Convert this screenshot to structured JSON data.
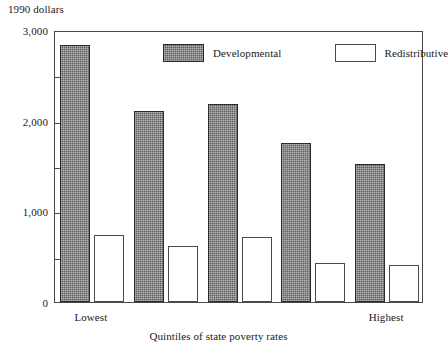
{
  "chart_data": {
    "type": "bar",
    "title": "",
    "ylabel": "1990 dollars",
    "xlabel": "Quintiles of state poverty rates",
    "ylim": [
      0,
      3000
    ],
    "grid": false,
    "legend_position": "top-center",
    "categories": [
      "Lowest",
      "",
      "",
      "",
      "Highest"
    ],
    "ytick_labels": [
      "0",
      "1,000",
      "2,000",
      "3,000"
    ],
    "ytick_values": [
      0,
      1000,
      2000,
      3000
    ],
    "yminor_tick_values": [
      500,
      1500,
      2500
    ],
    "series": [
      {
        "name": "Developmental",
        "values": [
          2840,
          2110,
          2185,
          1750,
          1525
        ]
      },
      {
        "name": "Redistributive",
        "values": [
          740,
          620,
          715,
          425,
          405
        ]
      }
    ]
  },
  "axes": {
    "y_unit_caption": "1990 dollars",
    "x_axis_title": "Quintiles of state poverty rates",
    "x_first_label": "Lowest",
    "x_last_label": "Highest"
  },
  "legend": {
    "entries": [
      {
        "label": "Developmental",
        "swatch": "dark-hatched"
      },
      {
        "label": "Redistributive",
        "swatch": "white-outlined"
      }
    ]
  },
  "colors": {
    "developmental_fill": "#5d5d5d",
    "redistributive_fill": "#ffffff",
    "axis_line": "#4a4a4a",
    "text": "#1a1a1a",
    "background": "#ffffff"
  }
}
